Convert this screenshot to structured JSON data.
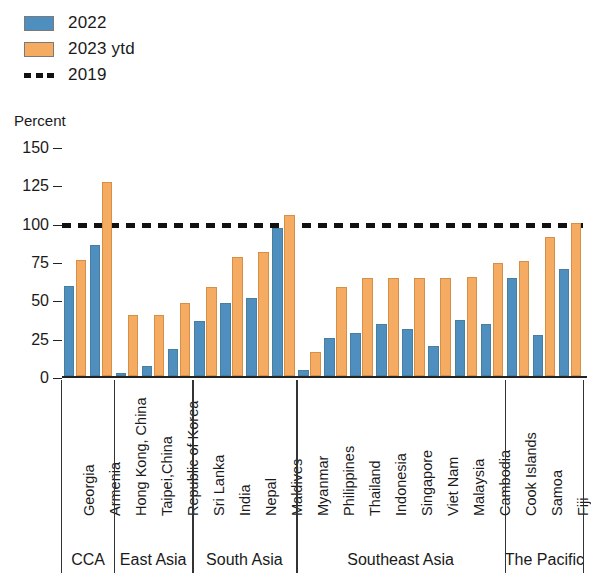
{
  "legend": {
    "items": [
      {
        "label": "2022",
        "type": "swatch",
        "color": "#4e8fc0"
      },
      {
        "label": "2023 ytd",
        "type": "swatch",
        "color": "#f6ab63"
      },
      {
        "label": "2019",
        "type": "dashed",
        "color": "#111111"
      }
    ]
  },
  "axis_title": "Percent",
  "chart_data": {
    "type": "bar",
    "title": "",
    "subtitle": "",
    "xlabel": "",
    "ylabel": "Percent",
    "ylim": [
      0,
      150
    ],
    "yticks": [
      0,
      25,
      50,
      75,
      100,
      125,
      150
    ],
    "grid": false,
    "legend_position": "top-left",
    "reference_line": {
      "label": "2019",
      "value": 100,
      "style": "dashed",
      "color": "#111111"
    },
    "categories": [
      "Georgia",
      "Armenia",
      "Hong Kong, China",
      "Taipei,China",
      "Republic of Korea",
      "Sri Lanka",
      "India",
      "Nepal",
      "Maldives",
      "Myanmar",
      "Philippines",
      "Thailand",
      "Indonesia",
      "Singapore",
      "Viet Nam",
      "Malaysia",
      "Cambodia",
      "Cook Islands",
      "Samoa",
      "Fiji"
    ],
    "groups": [
      {
        "label": "CCA",
        "categories": [
          "Georgia",
          "Armenia"
        ]
      },
      {
        "label": "East Asia",
        "categories": [
          "Hong Kong, China",
          "Taipei,China",
          "Republic of Korea"
        ]
      },
      {
        "label": "South Asia",
        "categories": [
          "Sri Lanka",
          "India",
          "Nepal",
          "Maldives"
        ]
      },
      {
        "label": "Southeast Asia",
        "categories": [
          "Myanmar",
          "Philippines",
          "Thailand",
          "Indonesia",
          "Singapore",
          "Viet Nam",
          "Malaysia",
          "Cambodia"
        ]
      },
      {
        "label": "The Pacific",
        "categories": [
          "Cook Islands",
          "Samoa",
          "Fiji"
        ]
      }
    ],
    "series": [
      {
        "name": "2022",
        "color": "#4e8fc0",
        "values": [
          59,
          86,
          2,
          7,
          18,
          36,
          48,
          51,
          97,
          4,
          25,
          28,
          34,
          31,
          20,
          37,
          34,
          64,
          27,
          70
        ]
      },
      {
        "name": "2023 ytd",
        "color": "#f6ab63",
        "values": [
          76,
          127,
          40,
          40,
          48,
          58,
          78,
          81,
          105,
          16,
          58,
          64,
          64,
          64,
          64,
          65,
          74,
          75,
          91,
          100
        ]
      }
    ]
  }
}
